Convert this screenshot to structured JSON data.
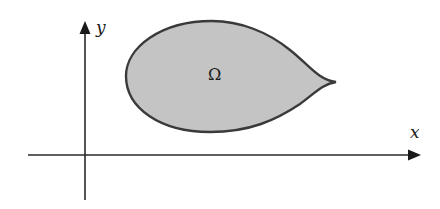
{
  "diagram": {
    "axes": {
      "x_label": "x",
      "y_label": "y",
      "origin": [
        85,
        155
      ]
    },
    "region": {
      "label": "Ω",
      "fill_color": "#c4c4c4",
      "stroke_color": "#3a3a3a",
      "shape": "teardrop"
    }
  }
}
